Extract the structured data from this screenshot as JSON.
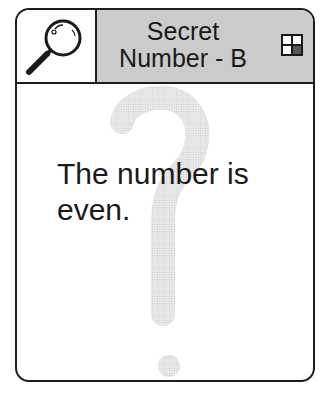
{
  "card": {
    "title_line1": "Secret",
    "title_line2": "Number - B",
    "clue": "The number is even.",
    "icons": {
      "header_left": "magnifying-glass-icon",
      "header_right": "grid-quadrant-icon",
      "background": "question-mark-icon"
    },
    "colors": {
      "border": "#1e1e1e",
      "header_fill": "#dcdcdc",
      "watermark": "#e2e2e2",
      "text": "#1a1a1a"
    }
  }
}
